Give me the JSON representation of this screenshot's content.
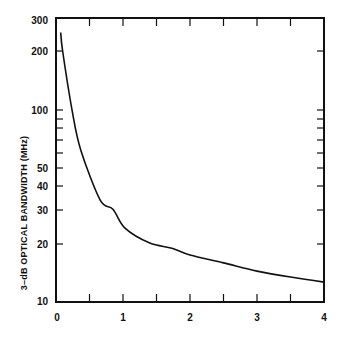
{
  "chart_data": {
    "type": "line",
    "title": "",
    "xlabel": "",
    "ylabel": "3-dB OPTICAL BANDWIDTH (MHz)",
    "xscale": "linear",
    "yscale": "log",
    "xlim": [
      0,
      4
    ],
    "ylim": [
      10,
      300
    ],
    "grid": false,
    "legend": null,
    "x_ticks": [
      0,
      0.5,
      1,
      1.5,
      2,
      2.5,
      3,
      3.5,
      4
    ],
    "x_tick_labels": [
      "0",
      "1",
      "2",
      "3",
      "4"
    ],
    "y_tick_labels": [
      "10",
      "20",
      "30",
      "40",
      "50",
      "100",
      "200",
      "300"
    ],
    "y_minor_ticks": [
      60,
      70,
      80,
      90
    ],
    "series": [
      {
        "name": "bandwidth",
        "x": [
          0.07,
          0.1,
          0.24,
          0.37,
          0.66,
          0.85,
          1.03,
          1.4,
          1.73,
          2.0,
          2.5,
          3.0,
          3.5,
          4.0
        ],
        "values": [
          255,
          203,
          100,
          62,
          34,
          30.5,
          24.3,
          20.3,
          19.1,
          17.6,
          16.0,
          14.5,
          13.5,
          12.7
        ]
      }
    ]
  },
  "labels": {
    "ylabel": "3–dB OPTICAL BANDWIDTH (MHz)",
    "y": {
      "t300": "300",
      "t200": "200",
      "t100": "100",
      "t50": "50",
      "t40": "40",
      "t30": "30",
      "t20": "20",
      "t10": "10"
    },
    "x": {
      "t0": "0",
      "t1": "1",
      "t2": "2",
      "t3": "3",
      "t4": "4"
    }
  },
  "colors": {
    "line": "#111111",
    "axis": "#111111",
    "background": "#ffffff"
  }
}
